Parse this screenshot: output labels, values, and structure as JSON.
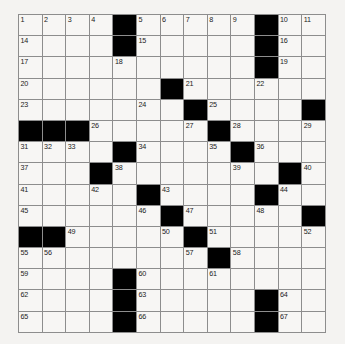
{
  "puzzle": {
    "type": "crossword-grid",
    "columns": 13,
    "rows": 15,
    "background_color": "#f4f3f1",
    "cell_color": "#f7f6f4",
    "block_color": "#000000",
    "line_color": "#8d8d8d",
    "max_clue_number": 67,
    "grid": [
      [
        {
          "n": "1"
        },
        {
          "n": "2"
        },
        {
          "n": "3"
        },
        {
          "n": "4"
        },
        {
          "b": true
        },
        {
          "n": "5"
        },
        {
          "n": "6"
        },
        {
          "n": "7"
        },
        {
          "n": "8"
        },
        {
          "n": "9"
        },
        {
          "b": true
        },
        {
          "n": "10"
        },
        {
          "n": "11"
        },
        {
          "n": "12"
        },
        {
          "n": "13"
        }
      ],
      [
        {
          "n": "14"
        },
        {},
        {},
        {},
        {
          "b": true
        },
        {
          "n": "15"
        },
        {},
        {},
        {},
        {},
        {
          "b": true
        },
        {
          "n": "16"
        },
        {},
        {},
        {}
      ],
      [
        {
          "n": "17"
        },
        {},
        {},
        {},
        {
          "n": "18"
        },
        {},
        {},
        {},
        {},
        {},
        {
          "b": true
        },
        {
          "n": "19"
        },
        {},
        {},
        {}
      ],
      [
        {
          "n": "20"
        },
        {},
        {},
        {},
        {},
        {},
        {
          "b": true
        },
        {
          "n": "21"
        },
        {},
        {},
        {
          "n": "22"
        },
        {},
        {},
        {},
        {}
      ],
      [
        {
          "n": "23"
        },
        {},
        {},
        {},
        {},
        {
          "n": "24"
        },
        {},
        {
          "b": true
        },
        {
          "n": "25"
        },
        {},
        {},
        {},
        {
          "b": true
        },
        {
          "b": true
        },
        {}
      ],
      [
        {
          "b": true
        },
        {
          "b": true
        },
        {
          "b": true
        },
        {
          "n": "26"
        },
        {},
        {},
        {},
        {
          "n": "27"
        },
        {
          "b": true
        },
        {
          "n": "28"
        },
        {},
        {},
        {
          "n": "29"
        },
        {
          "n": "30"
        },
        {}
      ],
      [
        {
          "n": "31"
        },
        {
          "n": "32"
        },
        {
          "n": "33"
        },
        {},
        {
          "b": true
        },
        {
          "n": "34"
        },
        {},
        {},
        {
          "n": "35"
        },
        {
          "b": true
        },
        {
          "n": "36"
        },
        {},
        {},
        {},
        {}
      ],
      [
        {
          "n": "37"
        },
        {},
        {},
        {
          "b": true
        },
        {
          "n": "38"
        },
        {},
        {},
        {},
        {},
        {
          "n": "39"
        },
        {},
        {
          "b": true
        },
        {
          "n": "40"
        },
        {},
        {}
      ],
      [
        {
          "n": "41"
        },
        {},
        {},
        {
          "n": "42"
        },
        {},
        {
          "b": true
        },
        {
          "n": "43"
        },
        {},
        {},
        {},
        {
          "b": true
        },
        {
          "n": "44"
        },
        {},
        {},
        {}
      ],
      [
        {
          "n": "45"
        },
        {},
        {},
        {},
        {},
        {
          "n": "46"
        },
        {
          "b": true
        },
        {
          "n": "47"
        },
        {},
        {},
        {
          "n": "48"
        },
        {},
        {
          "b": true
        },
        {
          "b": true
        },
        {}
      ],
      [
        {
          "b": true
        },
        {
          "b": true
        },
        {
          "n": "49"
        },
        {},
        {},
        {},
        {
          "n": "50"
        },
        {
          "b": true
        },
        {
          "n": "51"
        },
        {},
        {},
        {},
        {
          "n": "52"
        },
        {
          "n": "53"
        },
        {
          "n": "54"
        }
      ],
      [
        {
          "n": "55"
        },
        {
          "n": "56"
        },
        {},
        {},
        {},
        {},
        {},
        {
          "n": "57"
        },
        {
          "b": true
        },
        {
          "n": "58"
        },
        {},
        {},
        {},
        {},
        {}
      ],
      [
        {
          "n": "59"
        },
        {},
        {},
        {},
        {
          "b": true
        },
        {
          "n": "60"
        },
        {},
        {},
        {
          "n": "61"
        },
        {},
        {},
        {},
        {},
        {},
        {}
      ],
      [
        {
          "n": "62"
        },
        {},
        {},
        {},
        {
          "b": true
        },
        {
          "n": "63"
        },
        {},
        {},
        {},
        {},
        {
          "b": true
        },
        {
          "n": "64"
        },
        {},
        {},
        {}
      ],
      [
        {
          "n": "65"
        },
        {},
        {},
        {},
        {
          "b": true
        },
        {
          "n": "66"
        },
        {},
        {},
        {},
        {},
        {
          "b": true
        },
        {
          "n": "67"
        },
        {},
        {},
        {}
      ]
    ]
  }
}
